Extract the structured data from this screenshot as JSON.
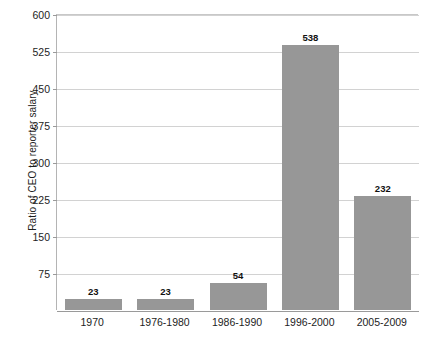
{
  "chart_data": {
    "type": "bar",
    "title": "",
    "subtitle": "",
    "xlabel": "",
    "ylabel": "Ratio of CEO to reporter salary",
    "categories": [
      "1970",
      "1976-1980",
      "1986-1990",
      "1996-2000",
      "2005-2009"
    ],
    "values": [
      23,
      23,
      54,
      538,
      232
    ],
    "value_labels": [
      "23",
      "23",
      "54",
      "538",
      "232"
    ],
    "ylim": [
      0,
      600
    ],
    "y_ticks": [
      75,
      150,
      225,
      300,
      375,
      450,
      525,
      600
    ],
    "y_tick_labels": [
      "75",
      "150",
      "225",
      "300",
      "375",
      "450",
      "525",
      "600"
    ],
    "grid": "horizontal",
    "legend": "none",
    "bar_color": "#979797",
    "gridline_color": "#d2d2d2",
    "axis_color": "#9a9a9a",
    "background_color": "#ffffff"
  }
}
